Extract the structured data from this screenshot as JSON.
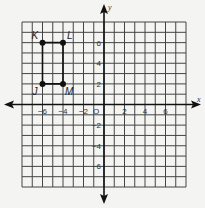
{
  "diagram": {
    "type": "coordinate-plane",
    "x_range": [
      -8,
      8
    ],
    "y_range": [
      -8,
      8
    ],
    "axis_labels": {
      "x": "x",
      "y": "y"
    },
    "origin_label": "O",
    "x_tick_labels": [
      {
        "value": -6,
        "label": "−6"
      },
      {
        "value": -4,
        "label": "−4"
      },
      {
        "value": -2,
        "label": "−2"
      },
      {
        "value": 2,
        "label": "2"
      },
      {
        "value": 4,
        "label": "4"
      },
      {
        "value": 6,
        "label": "6"
      }
    ],
    "y_tick_labels": [
      {
        "value": 6,
        "label": "6"
      },
      {
        "value": 4,
        "label": "4"
      },
      {
        "value": 2,
        "label": "2"
      },
      {
        "value": -2,
        "label": "−2"
      },
      {
        "value": -4,
        "label": "−4"
      },
      {
        "value": -6,
        "label": "−6"
      }
    ],
    "points": [
      {
        "name": "K",
        "x": -6,
        "y": 6
      },
      {
        "name": "L",
        "x": -4,
        "y": 6
      },
      {
        "name": "M",
        "x": -4,
        "y": 2
      },
      {
        "name": "J",
        "x": -6,
        "y": 2
      }
    ],
    "polygon": [
      "K",
      "L",
      "M",
      "J"
    ],
    "colors": {
      "line": "#111111",
      "grid": "#444444",
      "background": "#f4f4f2"
    }
  }
}
